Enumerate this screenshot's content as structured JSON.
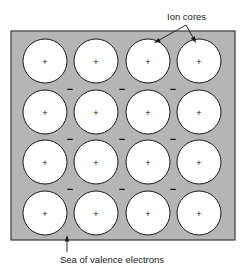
{
  "figure": {
    "background_color": "#ffffff",
    "lattice_fill_color": "#b5b5b5",
    "lattice_stroke_color": "#3c3c3c",
    "ion_core_fill_color": "#fefefe",
    "ion_core_stroke_color": "#1a1a1a",
    "glyph_color": "#1a1a1a"
  },
  "lattice": {
    "x": 11,
    "y": 31,
    "width": 224,
    "height": 209,
    "rows": 4,
    "columns": 4,
    "ion_core_radius": 22,
    "column_centers": [
      45,
      96,
      148,
      199
    ],
    "row_centers": [
      61,
      112,
      162,
      213
    ]
  },
  "ion_cores": {
    "charge_symbol": "+",
    "count": 16,
    "items": [
      {
        "row": 0,
        "col": 0,
        "cx": 45,
        "cy": 61,
        "label": "+"
      },
      {
        "row": 0,
        "col": 1,
        "cx": 96,
        "cy": 61,
        "label": "+"
      },
      {
        "row": 0,
        "col": 2,
        "cx": 148,
        "cy": 61,
        "label": "+"
      },
      {
        "row": 0,
        "col": 3,
        "cx": 199,
        "cy": 61,
        "label": "+"
      },
      {
        "row": 1,
        "col": 0,
        "cx": 45,
        "cy": 112,
        "label": "+"
      },
      {
        "row": 1,
        "col": 1,
        "cx": 96,
        "cy": 112,
        "label": "+"
      },
      {
        "row": 1,
        "col": 2,
        "cx": 148,
        "cy": 112,
        "label": "+"
      },
      {
        "row": 1,
        "col": 3,
        "cx": 199,
        "cy": 112,
        "label": "+"
      },
      {
        "row": 2,
        "col": 0,
        "cx": 45,
        "cy": 162,
        "label": "+"
      },
      {
        "row": 2,
        "col": 1,
        "cx": 96,
        "cy": 162,
        "label": "+"
      },
      {
        "row": 2,
        "col": 2,
        "cx": 148,
        "cy": 162,
        "label": "+"
      },
      {
        "row": 2,
        "col": 3,
        "cx": 199,
        "cy": 162,
        "label": "+"
      },
      {
        "row": 3,
        "col": 0,
        "cx": 45,
        "cy": 213,
        "label": "+"
      },
      {
        "row": 3,
        "col": 1,
        "cx": 96,
        "cy": 213,
        "label": "+"
      },
      {
        "row": 3,
        "col": 2,
        "cx": 148,
        "cy": 213,
        "label": "+"
      },
      {
        "row": 3,
        "col": 3,
        "cx": 199,
        "cy": 213,
        "label": "+"
      }
    ]
  },
  "valence_electrons": {
    "charge_symbol": "−",
    "count": 9,
    "items": [
      {
        "cx": 70,
        "cy": 89,
        "label": "−"
      },
      {
        "cx": 122,
        "cy": 89,
        "label": "−"
      },
      {
        "cx": 173,
        "cy": 89,
        "label": "−"
      },
      {
        "cx": 70,
        "cy": 139,
        "label": "−"
      },
      {
        "cx": 122,
        "cy": 139,
        "label": "−"
      },
      {
        "cx": 173,
        "cy": 139,
        "label": "−"
      },
      {
        "cx": 70,
        "cy": 189,
        "label": "−"
      },
      {
        "cx": 122,
        "cy": 189,
        "label": "−"
      },
      {
        "cx": 173,
        "cy": 189,
        "label": "−"
      }
    ]
  },
  "annotations": {
    "ion_cores": {
      "text": "Ion cores",
      "text_x": 167,
      "text_y": 20,
      "fork_x": 186,
      "fork_y": 25,
      "arrow_targets": [
        {
          "x": 154,
          "y": 43
        },
        {
          "x": 196,
          "y": 43
        }
      ]
    },
    "electron_sea": {
      "text": "Sea of valence electrons",
      "text_x": 60,
      "text_y": 263,
      "arrow_tail_x": 67,
      "arrow_tail_y": 252,
      "arrow_tip_x": 67,
      "arrow_tip_y": 235
    }
  }
}
